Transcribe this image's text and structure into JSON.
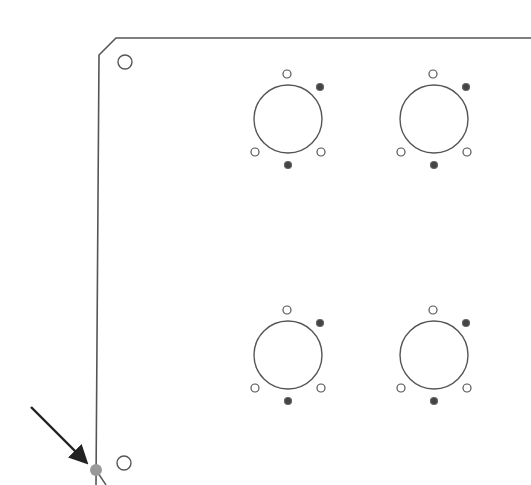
{
  "drawing": {
    "type": "panel-outline",
    "stroke_color": "#555555",
    "panel": {
      "outline_points": "531,38 116,38 99,55 96,485",
      "corner_holes": [
        {
          "cx": 125,
          "cy": 62,
          "r": 7
        },
        {
          "cx": 124,
          "cy": 463,
          "r": 7
        }
      ]
    },
    "connector_groups": [
      {
        "name": "top-left",
        "cx": 288,
        "cy": 119
      },
      {
        "name": "top-right",
        "cx": 434,
        "cy": 119
      },
      {
        "name": "bottom-left",
        "cx": 288,
        "cy": 355
      },
      {
        "name": "bottom-right",
        "cx": 434,
        "cy": 355
      }
    ],
    "connector_template": {
      "main_r": 34,
      "holes": [
        {
          "dx": -1,
          "dy": -45,
          "r": 4,
          "filled": false
        },
        {
          "dx": 32,
          "dy": -32,
          "r": 3.5,
          "filled": true
        },
        {
          "dx": -33,
          "dy": 33,
          "r": 4,
          "filled": false
        },
        {
          "dx": 33,
          "dy": 33,
          "r": 4,
          "filled": false
        },
        {
          "dx": 0,
          "dy": 46,
          "r": 3.5,
          "filled": true
        }
      ]
    },
    "pointer": {
      "arrow_from": {
        "x": 31,
        "y": 407
      },
      "arrow_to": {
        "x": 89,
        "y": 465
      },
      "arrow_color": "#222222",
      "marker": {
        "cx": 96,
        "cy": 470,
        "r": 6,
        "color": "#999999"
      }
    }
  }
}
